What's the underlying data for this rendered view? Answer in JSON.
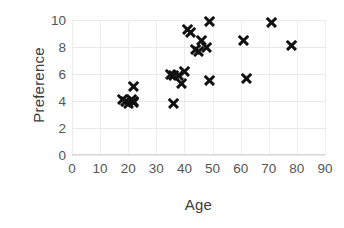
{
  "chart_data": {
    "type": "scatter",
    "title": "",
    "xlabel": "Age",
    "ylabel": "Preference",
    "xlim": [
      0,
      90
    ],
    "ylim": [
      0,
      10
    ],
    "xticks": [
      0,
      10,
      20,
      30,
      40,
      50,
      60,
      70,
      80,
      90
    ],
    "yticks": [
      0,
      2,
      4,
      6,
      8,
      10
    ],
    "grid": true,
    "legend": null,
    "marker": "x",
    "marker_color": "#111111",
    "points": [
      {
        "x": 18,
        "y": 4.1
      },
      {
        "x": 19,
        "y": 4.0
      },
      {
        "x": 20,
        "y": 3.8
      },
      {
        "x": 21,
        "y": 4.1
      },
      {
        "x": 22,
        "y": 4.0
      },
      {
        "x": 22,
        "y": 3.9
      },
      {
        "x": 22,
        "y": 5.1
      },
      {
        "x": 35,
        "y": 6.0
      },
      {
        "x": 36,
        "y": 5.9
      },
      {
        "x": 36,
        "y": 3.8
      },
      {
        "x": 38,
        "y": 5.9
      },
      {
        "x": 39,
        "y": 5.3
      },
      {
        "x": 40,
        "y": 6.2
      },
      {
        "x": 41,
        "y": 9.3
      },
      {
        "x": 42,
        "y": 9.1
      },
      {
        "x": 44,
        "y": 7.8
      },
      {
        "x": 45,
        "y": 7.7
      },
      {
        "x": 46,
        "y": 8.5
      },
      {
        "x": 48,
        "y": 8.0
      },
      {
        "x": 49,
        "y": 9.9
      },
      {
        "x": 49,
        "y": 5.5
      },
      {
        "x": 61,
        "y": 8.5
      },
      {
        "x": 62,
        "y": 5.7
      },
      {
        "x": 71,
        "y": 9.8
      },
      {
        "x": 78,
        "y": 8.1
      }
    ]
  }
}
